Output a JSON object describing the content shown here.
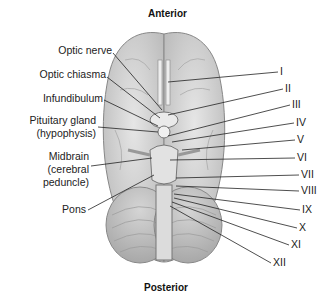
{
  "diagram": {
    "title_top": "Anterior",
    "title_bottom": "Posterior",
    "left_labels": [
      {
        "text": "Optic nerve",
        "x": 112,
        "y": 50
      },
      {
        "text": "Optic chiasma",
        "x": 106,
        "y": 74
      },
      {
        "text": "Infundibulum",
        "x": 103,
        "y": 98
      },
      {
        "text": "Pituitary gland",
        "x": 96,
        "y": 120
      },
      {
        "text": "(hypophysis)",
        "x": 96,
        "y": 133
      },
      {
        "text": "Midbrain",
        "x": 89,
        "y": 156
      },
      {
        "text": "(cerebral",
        "x": 89,
        "y": 169
      },
      {
        "text": "peduncle)",
        "x": 89,
        "y": 182
      },
      {
        "text": "Pons",
        "x": 86,
        "y": 209
      }
    ],
    "right_labels": [
      {
        "text": "I",
        "x": 280,
        "y": 70
      },
      {
        "text": "II",
        "x": 285,
        "y": 87
      },
      {
        "text": "III",
        "x": 292,
        "y": 103
      },
      {
        "text": "IV",
        "x": 296,
        "y": 121
      },
      {
        "text": "V",
        "x": 297,
        "y": 138
      },
      {
        "text": "VI",
        "x": 297,
        "y": 156
      },
      {
        "text": "VII",
        "x": 301,
        "y": 173
      },
      {
        "text": "VIII",
        "x": 301,
        "y": 189
      },
      {
        "text": "IX",
        "x": 302,
        "y": 208
      },
      {
        "text": "X",
        "x": 299,
        "y": 226
      },
      {
        "text": "XI",
        "x": 291,
        "y": 243
      },
      {
        "text": "XII",
        "x": 273,
        "y": 261
      }
    ],
    "colors": {
      "line": "#222222",
      "brain_fill": "#d8d8d8",
      "brain_stroke": "#888888"
    }
  }
}
